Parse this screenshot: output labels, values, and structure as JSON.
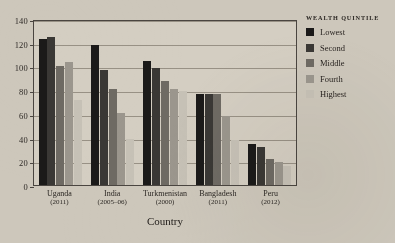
{
  "chart_data": {
    "type": "bar",
    "title": "",
    "xlabel": "Country",
    "ylabel": "Under-five mortality rate",
    "ylim": [
      0,
      140
    ],
    "ytick_step": 20,
    "yticks": [
      0,
      20,
      40,
      60,
      80,
      100,
      120,
      140
    ],
    "grid": true,
    "legend_position": "right",
    "legend_title": "WEALTH QUINTILE",
    "categories": [
      "Uganda",
      "India",
      "Turkmenistan",
      "Bangladesh",
      "Peru"
    ],
    "category_years": [
      "(2011)",
      "(2005–06)",
      "(2000)",
      "(2011)",
      "(2012)"
    ],
    "series": [
      {
        "name": "Lowest",
        "color": "#1b1a19",
        "values": [
          123,
          118,
          105,
          77,
          35
        ]
      },
      {
        "name": "Second",
        "color": "#3a3835",
        "values": [
          125,
          97,
          99,
          77,
          32
        ]
      },
      {
        "name": "Middle",
        "color": "#6e6a63",
        "values": [
          100,
          81,
          88,
          77,
          22
        ]
      },
      {
        "name": "Fourth",
        "color": "#9b968d",
        "values": [
          104,
          61,
          81,
          58,
          19
        ]
      },
      {
        "name": "Highest",
        "color": "#c6c1b6",
        "values": [
          72,
          39,
          79,
          38,
          16
        ]
      }
    ]
  }
}
